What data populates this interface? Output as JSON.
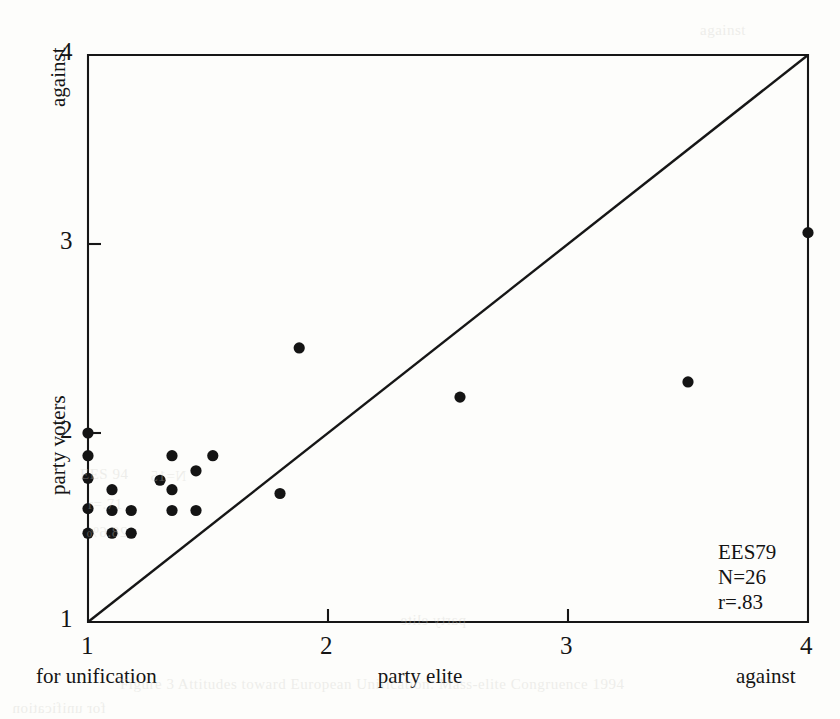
{
  "figure": {
    "kind": "scatterplot",
    "annotation": {
      "dataset": "EES79",
      "n": "N=26",
      "r": "r=.83"
    }
  },
  "axes": {
    "x": {
      "label": "party elite",
      "low_label": "for unification",
      "high_label": "against",
      "ticks": [
        "1",
        "2",
        "3",
        "4"
      ]
    },
    "y": {
      "label": "party voters",
      "high_label": "against",
      "low_label": "1",
      "ticks": [
        "1",
        "2",
        "3",
        "4"
      ]
    }
  },
  "bleed_text": [
    {
      "text": "Figure 3  Attitudes toward European Unification: Mass-elite Congruence 1994",
      "x": 120,
      "y": 676
    },
    {
      "text": "party elite",
      "x": 400,
      "y": 612
    },
    {
      "text": "EES 94",
      "x": 80,
      "y": 466
    },
    {
      "text": "N=15",
      "x": 150,
      "y": 468
    },
    {
      "text": "r=.71",
      "x": 88,
      "y": 496
    },
    {
      "text": "28.6%",
      "x": 86,
      "y": 524
    },
    {
      "text": "against",
      "x": 700,
      "y": 22
    },
    {
      "text": "for unification",
      "x": 12,
      "y": 700
    }
  ],
  "chart_data": {
    "type": "scatter",
    "title": "",
    "xlabel": "party elite",
    "ylabel": "party voters",
    "xlim": [
      1,
      4
    ],
    "ylim": [
      1,
      4
    ],
    "xticks": [
      1,
      2,
      3,
      4
    ],
    "yticks": [
      1,
      2,
      3,
      4
    ],
    "grid": false,
    "legend": null,
    "annotations": [
      "EES79",
      "N=26",
      "r=.83"
    ],
    "reference_line": {
      "type": "identity",
      "from": [
        1,
        1
      ],
      "to": [
        4,
        4
      ],
      "description": "45-degree line of perfect mass-elite congruence"
    },
    "n_points_plotted": 26,
    "points": [
      {
        "x": 1.0,
        "y": 2.0
      },
      {
        "x": 1.0,
        "y": 1.88
      },
      {
        "x": 1.0,
        "y": 1.76
      },
      {
        "x": 1.0,
        "y": 1.6
      },
      {
        "x": 1.0,
        "y": 1.47
      },
      {
        "x": 1.1,
        "y": 1.7
      },
      {
        "x": 1.1,
        "y": 1.59
      },
      {
        "x": 1.1,
        "y": 1.47
      },
      {
        "x": 1.18,
        "y": 1.59
      },
      {
        "x": 1.18,
        "y": 1.47
      },
      {
        "x": 1.3,
        "y": 1.75
      },
      {
        "x": 1.35,
        "y": 1.88
      },
      {
        "x": 1.35,
        "y": 1.7
      },
      {
        "x": 1.35,
        "y": 1.59
      },
      {
        "x": 1.45,
        "y": 1.8
      },
      {
        "x": 1.45,
        "y": 1.59
      },
      {
        "x": 1.52,
        "y": 1.88
      },
      {
        "x": 1.8,
        "y": 1.68
      },
      {
        "x": 1.88,
        "y": 2.45
      },
      {
        "x": 2.55,
        "y": 2.19
      },
      {
        "x": 3.5,
        "y": 2.27
      },
      {
        "x": 4.0,
        "y": 3.06
      }
    ]
  }
}
